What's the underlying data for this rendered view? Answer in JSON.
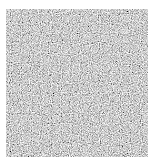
{
  "image": {
    "kind": "grayscale-noise-texture",
    "background": "#ffffff",
    "noise_region": {
      "x": 6,
      "y": 9,
      "width": 142,
      "height": 148
    },
    "tone_range": [
      "#3a3a3a",
      "#f2f2f2"
    ]
  }
}
